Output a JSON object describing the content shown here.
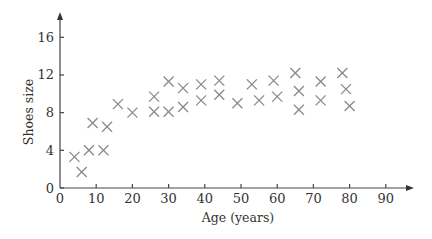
{
  "chart_data": {
    "type": "scatter",
    "title": "",
    "xlabel": "Age (years)",
    "ylabel": "Shoes size",
    "xlim": [
      0,
      95
    ],
    "ylim": [
      0,
      18
    ],
    "x_ticks": [
      0,
      10,
      20,
      30,
      40,
      50,
      60,
      70,
      80,
      90
    ],
    "y_ticks": [
      0,
      4,
      8,
      12,
      16
    ],
    "grid": false,
    "legend": null,
    "marker": "x",
    "marker_color": "#8a8a8a",
    "series": [
      {
        "name": "Shoes size vs age",
        "points": [
          {
            "x": 4,
            "y": 3.3
          },
          {
            "x": 6,
            "y": 1.7
          },
          {
            "x": 8,
            "y": 4
          },
          {
            "x": 9,
            "y": 6.9
          },
          {
            "x": 12,
            "y": 4
          },
          {
            "x": 13,
            "y": 6.5
          },
          {
            "x": 16,
            "y": 8.9
          },
          {
            "x": 20,
            "y": 8
          },
          {
            "x": 26,
            "y": 9.7
          },
          {
            "x": 26,
            "y": 8.1
          },
          {
            "x": 30,
            "y": 8.1
          },
          {
            "x": 30,
            "y": 11.3
          },
          {
            "x": 34,
            "y": 10.6
          },
          {
            "x": 34,
            "y": 8.6
          },
          {
            "x": 39,
            "y": 11
          },
          {
            "x": 39,
            "y": 9.3
          },
          {
            "x": 44,
            "y": 11.4
          },
          {
            "x": 44,
            "y": 9.9
          },
          {
            "x": 49,
            "y": 9
          },
          {
            "x": 53,
            "y": 11
          },
          {
            "x": 55,
            "y": 9.3
          },
          {
            "x": 59,
            "y": 11.4
          },
          {
            "x": 60,
            "y": 9.7
          },
          {
            "x": 65,
            "y": 12.2
          },
          {
            "x": 66,
            "y": 10.3
          },
          {
            "x": 66,
            "y": 8.3
          },
          {
            "x": 72,
            "y": 11.3
          },
          {
            "x": 72,
            "y": 9.3
          },
          {
            "x": 78,
            "y": 12.2
          },
          {
            "x": 79,
            "y": 10.5
          },
          {
            "x": 80,
            "y": 8.7
          }
        ]
      }
    ]
  },
  "layout": {
    "origin_px": [
      60,
      188
    ],
    "px_per_x_unit": 3.62,
    "px_per_y_unit": 9.42,
    "x_axis_end_px": 414,
    "y_axis_top_px": 12
  }
}
